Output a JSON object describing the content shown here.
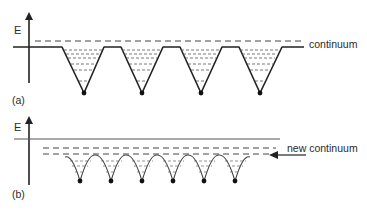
{
  "panels": [
    {
      "id": "a",
      "panel_label": "(a)",
      "axis_label": "E",
      "continuum_label": "continuum",
      "well_count": 4,
      "description": "Isolated potential wells with discrete bound levels below the continuum"
    },
    {
      "id": "b",
      "panel_label": "(b)",
      "axis_label": "E",
      "continuum_label": "new continuum",
      "well_count": 6,
      "description": "Closely spaced wells; overlapping levels form a new continuum below the original one"
    }
  ],
  "colors": {
    "line": "#222222",
    "dash": "#444444",
    "background": "#ffffff"
  }
}
